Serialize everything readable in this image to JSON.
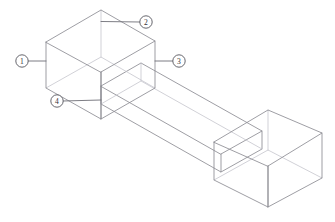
{
  "figure": {
    "background_color": "#ffffff",
    "line_color": "#8c8c93",
    "hidden_line_color": "#c2c2ca",
    "leader_color": "#6e6e76",
    "callout_stroke_color": "#55555c",
    "callout_fill_color": "#ffffff",
    "callout_text_color": "#333338"
  },
  "callouts": [
    {
      "id": "callout-1",
      "label": "1",
      "circle": {
        "cx": 22,
        "cy": 61,
        "r": 6.2
      },
      "leader": "M 28.4 61 L 46 61",
      "points_to": "left block front-left vertical edge"
    },
    {
      "id": "callout-2",
      "label": "2",
      "circle": {
        "cx": 146,
        "cy": 22,
        "r": 6.2
      },
      "leader": "M 139.8 22 L 101 21.5",
      "points_to": "left block top rear edge"
    },
    {
      "id": "callout-3",
      "label": "3",
      "circle": {
        "cx": 179,
        "cy": 61,
        "r": 6.2
      },
      "leader": "M 172.8 61 L 155 61",
      "points_to": "left block front-right vertical edge"
    },
    {
      "id": "callout-4",
      "label": "4",
      "circle": {
        "cx": 57,
        "cy": 101,
        "r": 6.2
      },
      "leader": "M 63.2 101 L 101 100",
      "points_to": "left block bottom front corner"
    }
  ],
  "geometry": {
    "left_block": {
      "name": "left end block",
      "top_face": "M 46 42 L 101 10 L 155 41 L 101 72 Z",
      "front_left_face": "M 46 42 L 46 88 L 101 119 L 101 72 Z",
      "front_right_face": "M 101 72 L 101 119 L 155 88 L 155 41 Z",
      "hidden_bottom_rear": "M 46 88 L 101 57 L 155 88",
      "hidden_rear_vertical": "M 101 57 L 101 10"
    },
    "right_block": {
      "name": "right end block",
      "top_face": "M 214 142 L 268 110 L 322 133 L 268 166 Z",
      "front_left_face": "M 214 142 L 214 180 L 268 207 L 268 166 Z",
      "front_right_face": "M 268 166 L 268 207 L 322 178 L 322 133 Z",
      "hidden_bottom_rear": "M 214 180 L 268 150 L 322 178",
      "hidden_rear_vertical": "M 268 150 L 268 110"
    },
    "connecting_bar": {
      "name": "center connecting bar",
      "top_face": "M 101 86 L 141 63 L 262 131 L 221 154 Z",
      "front_face": "M 101 86 L 101 104 L 221 172 L 221 154 Z",
      "side_face": "M 221 154 L 221 172 L 262 149 L 262 131 Z"
    }
  },
  "caption": {
    "text": "",
    "visible": false
  }
}
